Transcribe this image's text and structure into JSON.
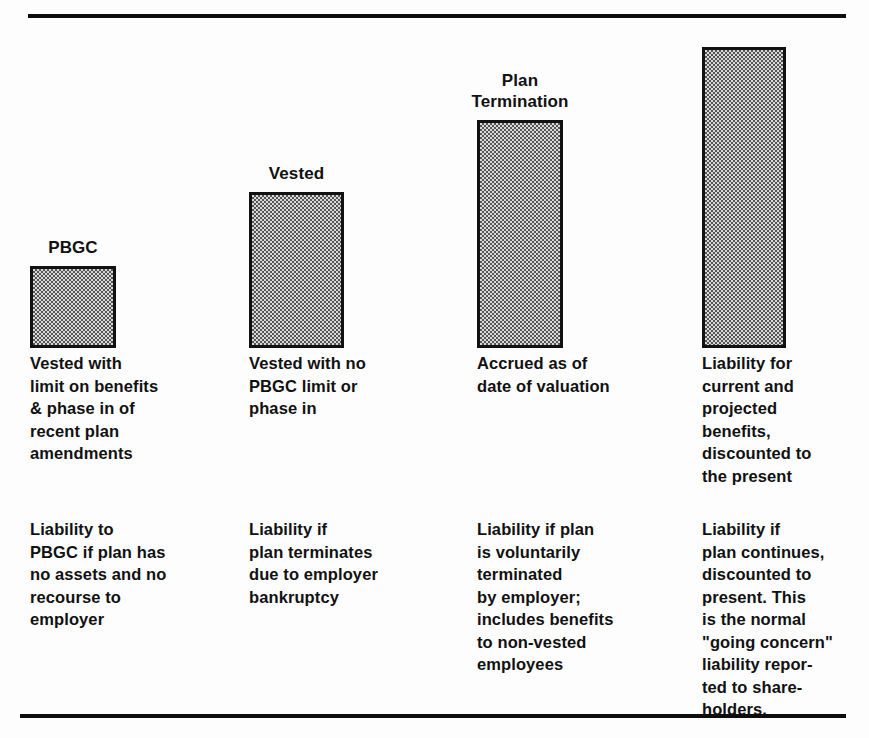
{
  "figure": {
    "rules": {
      "top_label": "top-horizontal-rule",
      "bottom_label": "bottom-horizontal-rule"
    }
  },
  "chart_data": {
    "type": "bar",
    "title": "",
    "subtitle": "",
    "xlabel": "",
    "ylabel": "",
    "grid": false,
    "legend": "none",
    "axis_visible": false,
    "value_unit": "relative pixel height of bar",
    "ylim": [
      0,
      310
    ],
    "categories": [
      "PBGC",
      "Vested",
      "Plan Termination",
      ""
    ],
    "values": [
      82,
      156,
      228,
      301
    ],
    "series": [
      {
        "name": "Pension liability measure (relative magnitude)",
        "values": [
          82,
          156,
          228,
          301
        ]
      }
    ],
    "bars": [
      {
        "index": 1,
        "top_label": "PBGC",
        "value": 82,
        "primary_caption": "Vested with\nlimit on benefits\n& phase in of\nrecent plan\namendments",
        "secondary_caption": "Liability to\nPBGC if plan has\nno assets and no\nrecourse to\nemployer"
      },
      {
        "index": 2,
        "top_label": "Vested",
        "value": 156,
        "primary_caption": "Vested with no\nPBGC limit or\nphase in",
        "secondary_caption": "Liability if\nplan terminates\ndue to employer\nbankruptcy"
      },
      {
        "index": 3,
        "top_label": "Plan\nTermination",
        "value": 228,
        "primary_caption": "Accrued as of\ndate of valuation",
        "secondary_caption": "Liability if plan\nis voluntarily\nterminated\nby employer;\nincludes benefits\nto non-vested\nemployees"
      },
      {
        "index": 4,
        "top_label": "",
        "value": 301,
        "primary_caption": "Liability for\ncurrent and\nprojected\nbenefits,\ndiscounted to\nthe present",
        "secondary_caption": "Liability if\nplan continues,\ndiscounted to\npresent. This\nis the normal\n\"going concern\"\nliability repor-\nted to share-\nholders."
      }
    ],
    "colors": {
      "bar_fill": "#d8d8d8",
      "bar_pattern": "#555555",
      "bar_border": "#111111",
      "text": "#111111",
      "background": "#fdfdfd",
      "rule": "#0d0d0d"
    }
  }
}
